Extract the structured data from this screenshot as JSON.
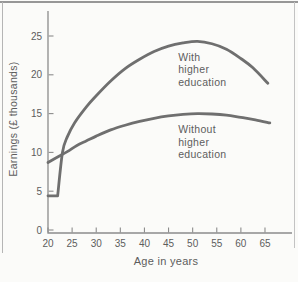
{
  "figure": {
    "background": "#fbfbf9",
    "frame": {
      "top_color": "#979797",
      "left_color": "#b5b5b5",
      "right_color": "#c3c3c3"
    }
  },
  "chart_data": {
    "type": "line",
    "title": "",
    "xlabel": "Age in years",
    "ylabel": "Earnings (£ thousands)",
    "x_ticks": [
      20,
      25,
      30,
      35,
      40,
      45,
      50,
      55,
      60,
      65
    ],
    "y_ticks": [
      0,
      5,
      10,
      15,
      20,
      25
    ],
    "xlim": [
      20,
      70.6
    ],
    "ylim": [
      0,
      28.2
    ],
    "grid": false,
    "legend_position": "inline-labels",
    "colors": {
      "line": "#6f6f6f",
      "axis": "#8c8c8c",
      "text": "#5d5d5d"
    },
    "series": [
      {
        "name": "With higher education",
        "points": [
          [
            20,
            4.4
          ],
          [
            22,
            4.4
          ],
          [
            23,
            10
          ],
          [
            24,
            12
          ],
          [
            25.5,
            13.8
          ],
          [
            28,
            15.9
          ],
          [
            30,
            17.3
          ],
          [
            33,
            19.2
          ],
          [
            36,
            20.8
          ],
          [
            39,
            22.0
          ],
          [
            42,
            23.0
          ],
          [
            45,
            23.7
          ],
          [
            48,
            24.1
          ],
          [
            51,
            24.3
          ],
          [
            54,
            24.0
          ],
          [
            57,
            23.3
          ],
          [
            60,
            22.1
          ],
          [
            62.5,
            20.9
          ],
          [
            65.6,
            18.9
          ]
        ],
        "corner_after": 1,
        "label": {
          "lines": [
            "With",
            "higher",
            "education"
          ],
          "age": 47,
          "value": 21.8
        }
      },
      {
        "name": "Without higher education",
        "points": [
          [
            20,
            8.7
          ],
          [
            22,
            9.4
          ],
          [
            24,
            10.1
          ],
          [
            26,
            10.9
          ],
          [
            28,
            11.5
          ],
          [
            30,
            12.1
          ],
          [
            33,
            12.9
          ],
          [
            36,
            13.5
          ],
          [
            39,
            14.0
          ],
          [
            42,
            14.4
          ],
          [
            45,
            14.7
          ],
          [
            48,
            14.9
          ],
          [
            51,
            15.0
          ],
          [
            54,
            14.95
          ],
          [
            57,
            14.8
          ],
          [
            60,
            14.5
          ],
          [
            63,
            14.2
          ],
          [
            66,
            13.8
          ]
        ],
        "label": {
          "lines": [
            "Without",
            "higher",
            "education"
          ],
          "age": 47,
          "value": 12.5
        }
      }
    ]
  }
}
